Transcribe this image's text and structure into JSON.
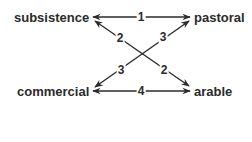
{
  "diagram": {
    "type": "relationship-diagram",
    "nodes": [
      {
        "id": "subsistence",
        "label": "subsistence"
      },
      {
        "id": "pastoral",
        "label": "pastoral"
      },
      {
        "id": "commercial",
        "label": "commercial"
      },
      {
        "id": "arable",
        "label": "arable"
      }
    ],
    "edges": [
      {
        "from": "subsistence",
        "to": "pastoral",
        "label": "1",
        "direction": "both"
      },
      {
        "from": "subsistence",
        "to": "arable",
        "label_start": "2",
        "label_end": "2",
        "direction": "both"
      },
      {
        "from": "commercial",
        "to": "pastoral",
        "label_start": "3",
        "label_end": "3",
        "direction": "both"
      },
      {
        "from": "commercial",
        "to": "arable",
        "label": "4",
        "direction": "both"
      }
    ],
    "colors": {
      "line": "#2b2b2b",
      "text": "#2b2b2b",
      "background": "#ffffff"
    }
  }
}
